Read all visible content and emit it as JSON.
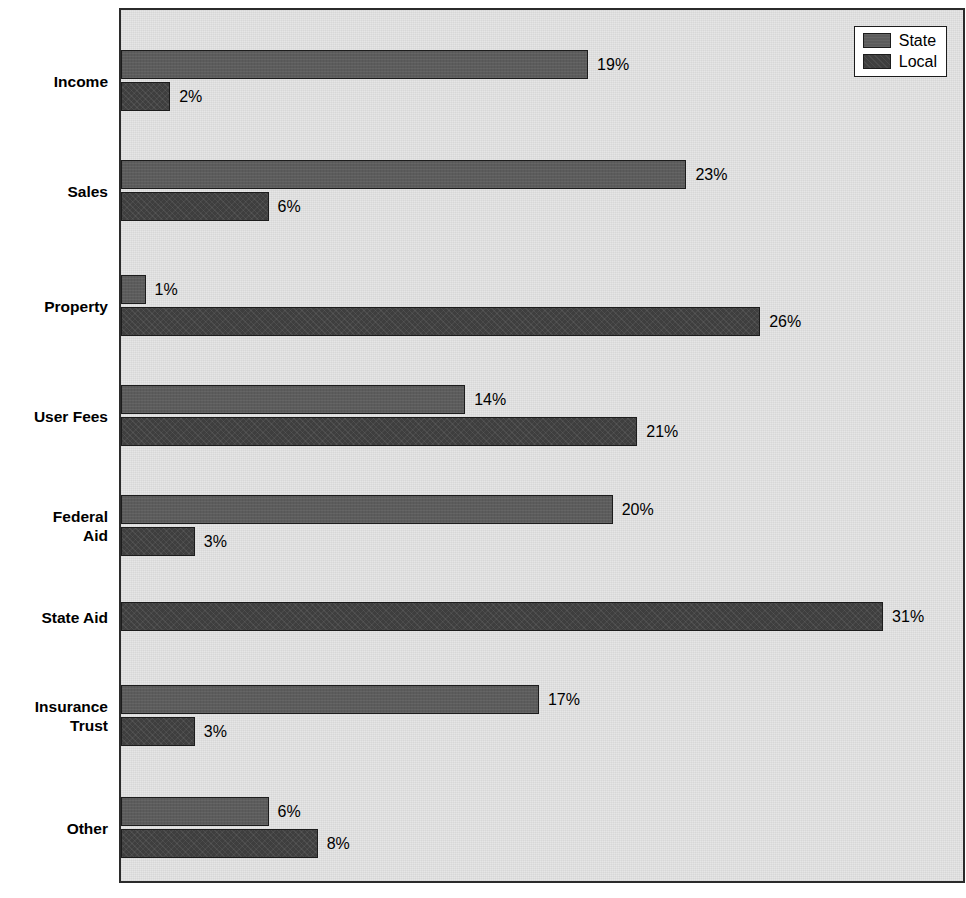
{
  "chart_data": {
    "type": "bar",
    "orientation": "horizontal",
    "title": "",
    "xlabel": "",
    "ylabel": "",
    "xlim": [
      0,
      34.25
    ],
    "grid": false,
    "legend_position": "top-right",
    "categories": [
      "Income",
      "Sales",
      "Property",
      "User Fees",
      "Federal\nAid",
      "State Aid",
      "Insurance\nTrust",
      "Other"
    ],
    "series": [
      {
        "name": "State",
        "color": "#5c5c5c",
        "values": [
          19,
          23,
          1,
          14,
          20,
          0,
          17,
          6
        ],
        "labels": [
          "19%",
          "23%",
          "1%",
          "14%",
          "20%",
          "",
          "17%",
          "6%"
        ]
      },
      {
        "name": "Local",
        "color": "#3e3e3e",
        "values": [
          2,
          6,
          26,
          21,
          3,
          31,
          3,
          8
        ],
        "labels": [
          "2%",
          "6%",
          "26%",
          "21%",
          "3%",
          "31%",
          "3%",
          "8%"
        ]
      }
    ]
  },
  "legend": {
    "entries": [
      {
        "label": "State",
        "swatch": "state"
      },
      {
        "label": "Local",
        "swatch": "local"
      }
    ]
  },
  "colors": {
    "state_bar": "#5c5c5c",
    "local_bar": "#3e3e3e",
    "plot_background": "#e6e6e6",
    "frame": "#2b2b2b",
    "text": "#000000"
  }
}
